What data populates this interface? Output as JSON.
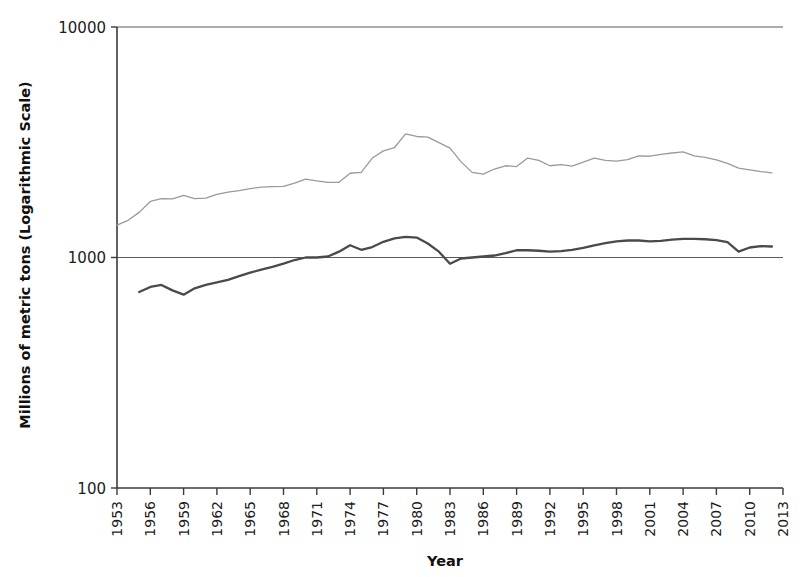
{
  "chart_data": {
    "type": "line",
    "title": "",
    "subtitle": "",
    "xlabel": "Year",
    "ylabel": "Millions of metric tons (Logarithmic Scale)",
    "y_scale": "log",
    "ylim": [
      100,
      10000
    ],
    "xlim": [
      1953,
      2013
    ],
    "grid": true,
    "grid_axis": "y",
    "legend_position": "none",
    "y_ticks": [
      10000,
      1000,
      100
    ],
    "y_tick_labels": [
      "10000",
      "1000",
      "100"
    ],
    "x_ticks": [
      1953,
      1956,
      1959,
      1962,
      1965,
      1968,
      1971,
      1974,
      1977,
      1980,
      1983,
      1986,
      1989,
      1992,
      1995,
      1998,
      2001,
      2004,
      2007,
      2010,
      2013
    ],
    "x_tick_labels": [
      "1953",
      "1956",
      "1959",
      "1962",
      "1965",
      "1968",
      "1971",
      "1974",
      "1977",
      "1980",
      "1983",
      "1986",
      "1989",
      "1992",
      "1995",
      "1998",
      "2001",
      "2004",
      "2007",
      "2010",
      "2013"
    ],
    "series": [
      {
        "name": "upper-series",
        "color": "#9a9a9a",
        "stroke_width": 1.3,
        "x": [
          1953,
          1954,
          1955,
          1956,
          1957,
          1958,
          1959,
          1960,
          1961,
          1962,
          1963,
          1964,
          1965,
          1966,
          1967,
          1968,
          1969,
          1970,
          1971,
          1972,
          1973,
          1974,
          1975,
          1976,
          1977,
          1978,
          1979,
          1980,
          1981,
          1982,
          1983,
          1984,
          1985,
          1986,
          1987,
          1988,
          1989,
          1990,
          1991,
          1992,
          1993,
          1994,
          1995,
          1996,
          1997,
          1998,
          1999,
          2000,
          2001,
          2002,
          2003,
          2004,
          2005,
          2006,
          2007,
          2008,
          2009,
          2010,
          2011,
          2012
        ],
        "y": [
          1383,
          1450,
          1570,
          1750,
          1800,
          1795,
          1860,
          1800,
          1810,
          1880,
          1920,
          1950,
          1990,
          2020,
          2030,
          2035,
          2100,
          2190,
          2150,
          2120,
          2120,
          2320,
          2340,
          2700,
          2900,
          3000,
          3440,
          3350,
          3330,
          3150,
          2980,
          2600,
          2340,
          2300,
          2420,
          2500,
          2480,
          2700,
          2640,
          2500,
          2530,
          2490,
          2590,
          2700,
          2640,
          2620,
          2660,
          2760,
          2750,
          2800,
          2840,
          2870,
          2760,
          2720,
          2650,
          2560,
          2440,
          2400,
          2360,
          2327
        ]
      },
      {
        "name": "lower-series",
        "color": "#4a4a4a",
        "stroke_width": 2.3,
        "x": [
          1955,
          1956,
          1957,
          1958,
          1959,
          1960,
          1961,
          1962,
          1963,
          1964,
          1965,
          1966,
          1967,
          1968,
          1969,
          1970,
          1971,
          1972,
          1973,
          1974,
          1975,
          1976,
          1977,
          1978,
          1979,
          1980,
          1981,
          1982,
          1983,
          1984,
          1985,
          1986,
          1987,
          1988,
          1989,
          1990,
          1991,
          1992,
          1993,
          1994,
          1995,
          1996,
          1997,
          1998,
          1999,
          2000,
          2001,
          2002,
          2003,
          2004,
          2005,
          2006,
          2007,
          2008,
          2009,
          2010,
          2011,
          2012
        ],
        "y": [
          708,
          745,
          760,
          720,
          690,
          735,
          760,
          780,
          800,
          830,
          860,
          885,
          910,
          940,
          975,
          1000,
          1000,
          1010,
          1060,
          1130,
          1080,
          1110,
          1170,
          1210,
          1230,
          1220,
          1150,
          1060,
          940,
          990,
          1000,
          1010,
          1020,
          1045,
          1075,
          1075,
          1070,
          1060,
          1065,
          1080,
          1100,
          1130,
          1155,
          1175,
          1185,
          1185,
          1175,
          1180,
          1195,
          1205,
          1205,
          1200,
          1190,
          1165,
          1060,
          1105,
          1120,
          1116
        ]
      }
    ]
  }
}
